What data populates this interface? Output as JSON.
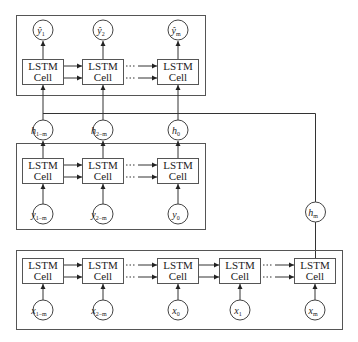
{
  "diagram": {
    "cell_label_line1": "LSTM",
    "cell_label_line2": "Cell",
    "decoder_output_row": {
      "nodes": [
        {
          "base": "ŷ",
          "sub": "1"
        },
        {
          "base": "ŷ",
          "sub": "2"
        },
        {
          "base": "ŷ",
          "sub": "m"
        }
      ]
    },
    "hidden_row": {
      "nodes": [
        {
          "base": "h",
          "sub": "1−m"
        },
        {
          "base": "h",
          "sub": "2−m"
        },
        {
          "base": "h",
          "sub": "0"
        }
      ]
    },
    "middle_input_row": {
      "nodes": [
        {
          "base": "y",
          "sub": "1−m"
        },
        {
          "base": "y",
          "sub": "2−m"
        },
        {
          "base": "y",
          "sub": "0"
        }
      ]
    },
    "encoder_input_row": {
      "nodes": [
        {
          "base": "x",
          "sub": "1−m"
        },
        {
          "base": "x",
          "sub": "2−m"
        },
        {
          "base": "x",
          "sub": "0"
        },
        {
          "base": "x",
          "sub": "1"
        },
        {
          "base": "x",
          "sub": "m"
        }
      ]
    },
    "final_state_node": {
      "base": "h",
      "sub": "m"
    },
    "ellipsis": "···",
    "colors": {
      "stroke": "#444444",
      "text": "#222222",
      "background": "#ffffff"
    }
  }
}
